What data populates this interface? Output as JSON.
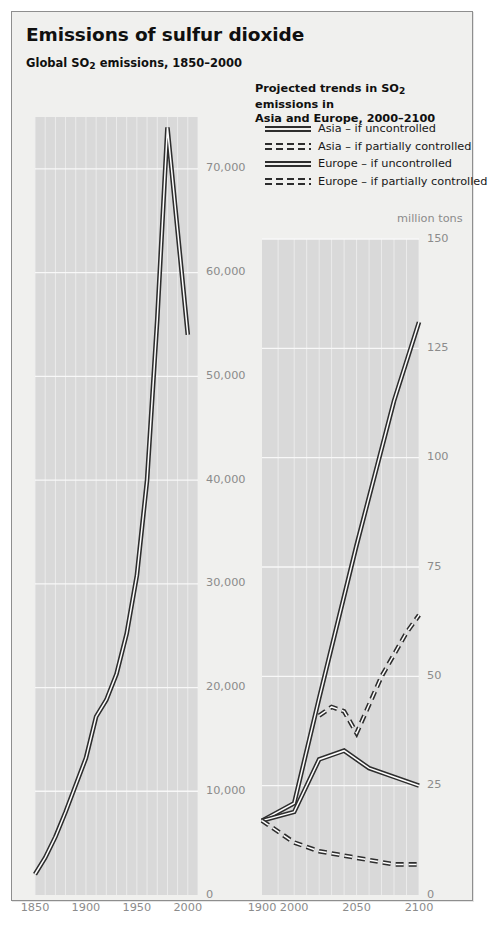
{
  "header": {
    "title": "Emissions of sulfur dioxide",
    "subtitle_prefix": "Global SO",
    "subtitle_sub": "2",
    "subtitle_suffix": " emissions, 1850–2000"
  },
  "legend": {
    "title_line1_prefix": "Projected trends in SO",
    "title_line1_sub": "2",
    "title_line1_suffix": " emissions in",
    "title_line2": "Asia and Europe, 2000–2100",
    "items": [
      {
        "label": "Asia – if uncontrolled",
        "style": "solid",
        "icon": "solid-double-line-icon"
      },
      {
        "label": "Asia – if partially controlled",
        "style": "dashed",
        "icon": "dashed-double-line-icon"
      },
      {
        "label": "Europe – if uncontrolled",
        "style": "solid",
        "icon": "solid-double-line-icon"
      },
      {
        "label": "Europe – if partially controlled",
        "style": "dashed",
        "icon": "dashed-double-line-icon"
      }
    ]
  },
  "colors": {
    "card_background": "#f0f0ee",
    "plot_background": "#d9d9d9",
    "gridline": "#efefef",
    "line_dark": "#2d2d2d",
    "tick_text": "#8b8b8b",
    "border": "#8e8e8e"
  },
  "chart_data": [
    {
      "id": "left-chart",
      "type": "line",
      "title": "Global SO2 emissions, 1850–2000",
      "xlabel": "",
      "ylabel": "",
      "unit": "",
      "grid": true,
      "legend_position": "none",
      "xlim": [
        1850,
        2010
      ],
      "ylim": [
        0,
        75000
      ],
      "xticks": [
        1850,
        1900,
        1950,
        2000
      ],
      "xtick_labels": [
        "1850",
        "1900",
        "1950",
        "2000"
      ],
      "yticks": [
        0,
        10000,
        20000,
        30000,
        40000,
        50000,
        60000,
        70000
      ],
      "ytick_labels": [
        "0",
        "10,000",
        "20,000",
        "30,000",
        "40,000",
        "50,000",
        "60,000",
        "70,000"
      ],
      "series": [
        {
          "name": "Global SO2 emissions",
          "style": "solid",
          "x": [
            1850,
            1860,
            1870,
            1880,
            1890,
            1900,
            1910,
            1920,
            1930,
            1940,
            1950,
            1960,
            1970,
            1980,
            1990,
            2000
          ],
          "values": [
            2000,
            3600,
            5600,
            8000,
            10600,
            13200,
            17200,
            18800,
            21300,
            25200,
            30800,
            40000,
            55500,
            74000,
            64000,
            54000
          ]
        }
      ]
    },
    {
      "id": "right-chart",
      "type": "line",
      "title": "Projected trends in SO2 emissions in Asia and Europe, 2000–2100",
      "xlabel": "",
      "ylabel": "",
      "unit": "million tons",
      "grid": true,
      "legend_position": "top",
      "xlim": [
        1900,
        2100
      ],
      "ylim": [
        0,
        150
      ],
      "xticks": [
        1900,
        2000,
        2050,
        2100
      ],
      "xtick_labels": [
        "1900",
        "2000",
        "2050",
        "2100"
      ],
      "yticks": [
        0,
        25,
        50,
        75,
        100,
        125,
        150
      ],
      "ytick_labels": [
        "0",
        "25",
        "50",
        "75",
        "100",
        "125",
        "150"
      ],
      "series": [
        {
          "name": "Asia – if uncontrolled",
          "style": "solid",
          "x": [
            1900,
            2000,
            2020,
            2050,
            2080,
            2100
          ],
          "values": [
            17,
            21,
            45,
            80,
            113,
            131
          ]
        },
        {
          "name": "Asia – if partially controlled",
          "style": "dashed",
          "x": [
            2020,
            2030,
            2040,
            2050,
            2070,
            2090,
            2100
          ],
          "values": [
            41,
            43,
            42,
            37,
            50,
            60,
            64
          ]
        },
        {
          "name": "Europe – if uncontrolled",
          "style": "solid",
          "x": [
            1900,
            2000,
            2020,
            2040,
            2060,
            2080,
            2100
          ],
          "values": [
            17,
            19,
            31,
            33,
            29,
            27,
            25
          ]
        },
        {
          "name": "Europe – if partially controlled",
          "style": "dashed",
          "x": [
            1900,
            2000,
            2020,
            2040,
            2060,
            2080,
            2100
          ],
          "values": [
            17,
            12,
            10,
            9,
            8,
            7,
            7
          ]
        }
      ]
    }
  ]
}
